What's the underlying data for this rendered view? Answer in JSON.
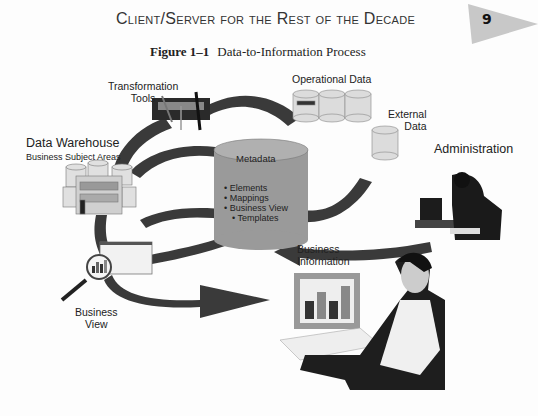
{
  "page": {
    "running_head": "Client/Server for the Rest of the Decade",
    "page_number": "9"
  },
  "figure": {
    "number": "Figure 1–1",
    "title": "Data-to-Information Process",
    "labels": {
      "transformation_tools_line1": "Transformation",
      "transformation_tools_line2": "Tools",
      "operational_data": "Operational Data",
      "external_data_line1": "External",
      "external_data_line2": "Data",
      "administration": "Administration",
      "data_warehouse": "Data Warehouse",
      "data_warehouse_sub": "Business Subject Areas",
      "metadata": "Metadata",
      "business_information_line1": "Business",
      "business_information_line2": "Information",
      "business_view_line1": "Business",
      "business_view_line2": "View"
    },
    "metadata_items": [
      "Elements",
      "Mappings",
      "Business View",
      "Templates"
    ],
    "colors": {
      "arrow": "#3a3a3a",
      "metadata_cylinder": "#9a9a9a",
      "badge": "#c8c8c8"
    }
  }
}
